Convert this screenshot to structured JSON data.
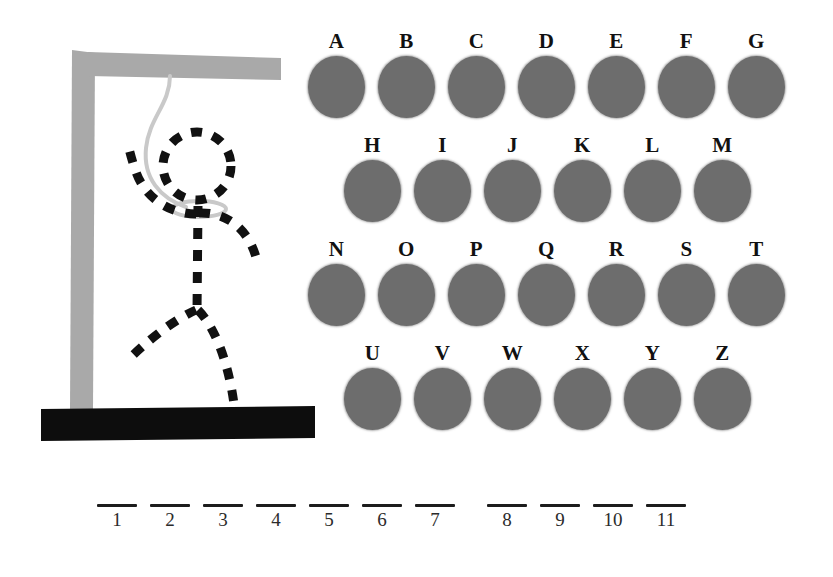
{
  "game": {
    "title": "Hangman",
    "colors": {
      "background": "#ffffff",
      "gallows": "#a9a9a9",
      "base": "#0d0d0d",
      "rope": "#c9c9c9",
      "figure": "#111111",
      "key_disc": "#6d6d6d",
      "key_label": "#111111",
      "blank_rule": "#1c1c1c"
    }
  },
  "gallows": {
    "parts": [
      {
        "name": "post",
        "color": "#a9a9a9"
      },
      {
        "name": "beam",
        "color": "#a9a9a9"
      },
      {
        "name": "base",
        "color": "#0d0d0d"
      },
      {
        "name": "rope",
        "color": "#c9c9c9"
      },
      {
        "name": "noose-loop",
        "color": "#c9c9c9"
      }
    ],
    "figure_parts": [
      "head",
      "left-arm",
      "right-arm",
      "body",
      "left-leg",
      "right-leg"
    ],
    "wrong_guesses": 6,
    "figure_style": "dashed"
  },
  "keyboard": {
    "rows": [
      {
        "indented": false,
        "keys": [
          "A",
          "B",
          "C",
          "D",
          "E",
          "F",
          "G"
        ]
      },
      {
        "indented": true,
        "keys": [
          "H",
          "I",
          "J",
          "K",
          "L",
          "M"
        ]
      },
      {
        "indented": false,
        "keys": [
          "N",
          "O",
          "P",
          "Q",
          "R",
          "S",
          "T"
        ]
      },
      {
        "indented": true,
        "keys": [
          "U",
          "V",
          "W",
          "X",
          "Y",
          "Z"
        ]
      }
    ]
  },
  "word": {
    "groups": [
      {
        "start_x": 95,
        "slots": [
          {
            "index": "1",
            "letter": ""
          },
          {
            "index": "2",
            "letter": ""
          },
          {
            "index": "3",
            "letter": ""
          },
          {
            "index": "4",
            "letter": ""
          },
          {
            "index": "5",
            "letter": ""
          },
          {
            "index": "6",
            "letter": ""
          },
          {
            "index": "7",
            "letter": ""
          }
        ]
      },
      {
        "start_x": 485,
        "slots": [
          {
            "index": "8",
            "letter": ""
          },
          {
            "index": "9",
            "letter": ""
          },
          {
            "index": "10",
            "letter": ""
          },
          {
            "index": "11",
            "letter": ""
          }
        ]
      }
    ],
    "slot_pitch": 53
  }
}
